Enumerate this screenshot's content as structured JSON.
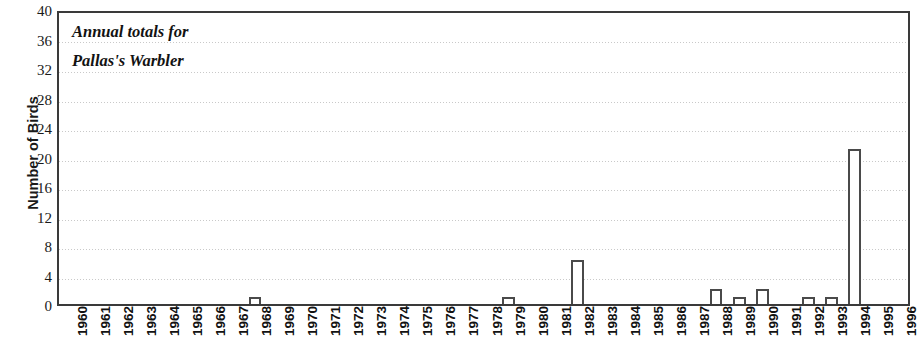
{
  "chart_data": {
    "type": "bar",
    "title": "Annual totals for\nPallas's Warbler",
    "title_lines": [
      "Annual totals for",
      "Pallas's Warbler"
    ],
    "xlabel": "",
    "ylabel": "Number of Birds",
    "ylim": [
      0,
      40
    ],
    "ytick_step": 4,
    "grid": true,
    "legend": null,
    "bar_style": {
      "fill": "#ffffff",
      "edge": "#4a4a4a",
      "gridline_color": "#c9c9c9",
      "axis_color": "#3a3a3a",
      "text_color": "#121212"
    },
    "yticks": [
      0,
      4,
      8,
      12,
      16,
      20,
      24,
      28,
      32,
      36,
      40
    ],
    "categories": [
      "1960",
      "1961",
      "1962",
      "1963",
      "1964",
      "1965",
      "1966",
      "1967",
      "1968",
      "1969",
      "1970",
      "1971",
      "1972",
      "1973",
      "1974",
      "1975",
      "1976",
      "1977",
      "1978",
      "1979",
      "1980",
      "1981",
      "1982",
      "1983",
      "1984",
      "1985",
      "1986",
      "1987",
      "1988",
      "1989",
      "1990",
      "1991",
      "1992",
      "1993",
      "1994",
      "1995",
      "1996"
    ],
    "values": [
      0,
      0,
      0,
      0,
      0,
      0,
      0,
      0,
      1,
      0,
      0,
      0,
      0,
      0,
      0,
      0,
      0,
      0,
      0,
      1,
      0,
      0,
      6,
      0,
      0,
      0,
      0,
      0,
      2,
      1,
      2,
      0,
      1,
      1,
      21,
      0,
      0
    ]
  }
}
